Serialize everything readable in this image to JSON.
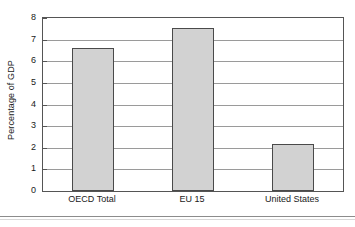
{
  "chart_data": {
    "type": "bar",
    "title": "",
    "subtitle": "",
    "xlabel": "",
    "ylabel": "Percentage of GDP",
    "categories": [
      "OECD Total",
      "EU 15",
      "United States"
    ],
    "values": [
      6.6,
      7.55,
      2.18
    ],
    "series": [
      {
        "name": "Percentage of GDP",
        "values": [
          6.6,
          7.55,
          2.18
        ]
      }
    ],
    "ylim": [
      0,
      8
    ],
    "ytick_values": [
      0,
      1,
      2,
      3,
      4,
      5,
      6,
      7,
      8
    ],
    "ytick_labels": [
      "0",
      "1",
      "2",
      "3",
      "4",
      "5",
      "6",
      "7",
      "8"
    ],
    "grid": true,
    "grid_axis": "y",
    "legend": false,
    "legend_position": "none",
    "bar_fill_color": "#d2d2d2",
    "bar_edge_color": "#4a4a4a",
    "grid_color": "#9a9a9a",
    "axis_color": "#555555",
    "background_color": "#ffffff",
    "annotations": []
  }
}
